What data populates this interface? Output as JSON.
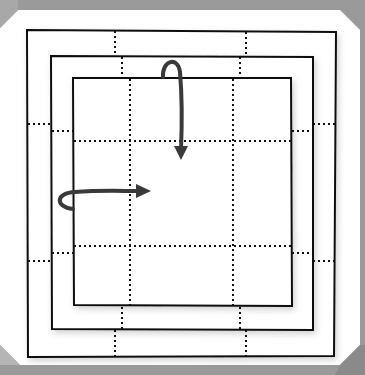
{
  "diagram": {
    "title": "",
    "type": "origami-fold-steps",
    "colors": {
      "background": "#9a9a9a",
      "paper": "#ffffff",
      "line": "#111111",
      "arrow": "#3a3a3a"
    },
    "layers": [
      {
        "id": "outer-square",
        "role": "unfolded paper",
        "grid": "4x4 dotted"
      },
      {
        "id": "middle-square",
        "role": "first fold",
        "grid": "dotted"
      },
      {
        "id": "inner-square",
        "role": "second fold",
        "grid": "3x3 dotted"
      }
    ],
    "arrows": [
      {
        "id": "fold-top-down",
        "direction": "down",
        "meaning": "fold top edge down"
      },
      {
        "id": "fold-left-right",
        "direction": "right",
        "meaning": "fold left edge right"
      }
    ]
  }
}
